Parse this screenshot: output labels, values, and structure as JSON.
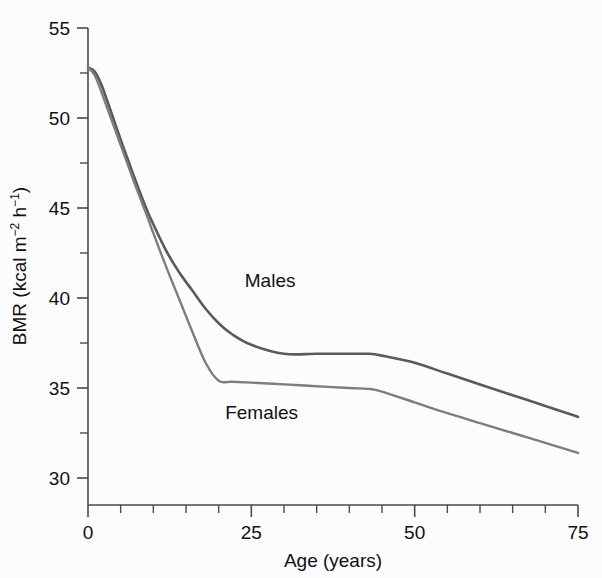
{
  "chart_data": {
    "type": "line",
    "title": "",
    "xlabel": "Age (years)",
    "ylabel": "BMR (kcal m⁻² h⁻¹)",
    "ylabel_parts": {
      "prefix": "BMR (kcal m",
      "sup1": "−2",
      "mid": " h",
      "sup2": "−1",
      "suffix": ")"
    },
    "xlim": [
      0,
      75
    ],
    "ylim": [
      28.5,
      55
    ],
    "grid": false,
    "legend_position": "inline-annotation",
    "x_ticks_major": [
      0,
      25,
      50,
      75
    ],
    "x_tick_labels": [
      "0",
      "25",
      "50",
      "75"
    ],
    "x_ticks_minor": [
      5,
      10,
      15,
      20,
      30,
      35,
      40,
      45,
      55,
      60,
      65,
      70
    ],
    "y_ticks_major": [
      30,
      35,
      40,
      45,
      50,
      55
    ],
    "y_tick_labels": [
      "30",
      "35",
      "40",
      "45",
      "50",
      "55"
    ],
    "y_ticks_minor": [
      32.5,
      37.5,
      42.5,
      47.5,
      52.5
    ],
    "x": [
      0,
      1,
      2,
      3,
      5,
      7,
      9,
      10,
      12,
      14,
      16,
      18,
      20,
      22,
      25,
      30,
      35,
      40,
      43,
      45,
      50,
      55,
      60,
      65,
      70,
      75
    ],
    "series": [
      {
        "name": "Males",
        "label": "Males",
        "color": "#5a5a5a",
        "stroke_width": 2.6,
        "annotation": {
          "text": "Males",
          "x": 24,
          "y": 40.6
        },
        "values": [
          52.8,
          52.6,
          51.9,
          50.9,
          48.8,
          46.8,
          44.9,
          44.1,
          42.6,
          41.4,
          40.4,
          39.4,
          38.6,
          38.0,
          37.4,
          36.9,
          36.9,
          36.9,
          36.9,
          36.8,
          36.4,
          35.8,
          35.2,
          34.6,
          34.0,
          33.4
        ]
      },
      {
        "name": "Females",
        "label": "Females",
        "color": "#7d7d7d",
        "stroke_width": 2.4,
        "annotation": {
          "text": "Females",
          "x": 21,
          "y": 33.3
        },
        "values": [
          52.8,
          52.4,
          51.5,
          50.5,
          48.5,
          46.5,
          44.6,
          43.6,
          41.7,
          39.9,
          38.1,
          36.4,
          35.4,
          35.35,
          35.3,
          35.2,
          35.1,
          35.0,
          34.95,
          34.8,
          34.2,
          33.6,
          33.05,
          32.5,
          31.95,
          31.4
        ]
      }
    ],
    "annotations": [
      {
        "text": "Males",
        "age": 24,
        "bmr": 40.6
      },
      {
        "text": "Females",
        "age": 21,
        "bmr": 33.3
      }
    ]
  },
  "figure": {
    "background_color": "#fcfcfc",
    "axis_color": "#4a4a4a",
    "text_color": "#111111"
  }
}
